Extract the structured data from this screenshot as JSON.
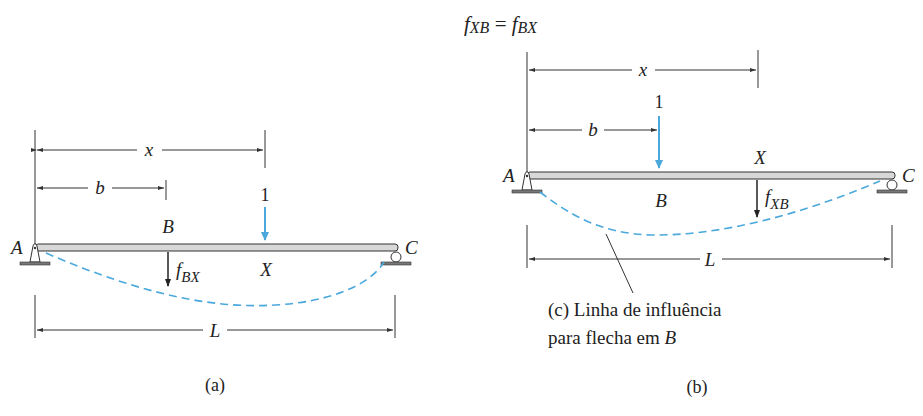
{
  "figure_a": {
    "caption": "(a)",
    "support_left": "A",
    "support_right": "C",
    "point_b": "B",
    "point_x": "X",
    "load_value": "1",
    "dim_x": "x",
    "dim_b": "b",
    "dim_L": "L",
    "deflection_label_main": "f",
    "deflection_label_sub": "BX"
  },
  "figure_b": {
    "caption": "(b)",
    "reciprocity_lhs_main": "f",
    "reciprocity_lhs_sub": "XB",
    "reciprocity_eq": " = ",
    "reciprocity_rhs_main": "f",
    "reciprocity_rhs_sub": "BX",
    "support_left": "A",
    "support_right": "C",
    "point_b": "B",
    "point_x": "X",
    "load_value": "1",
    "dim_x": "x",
    "dim_b": "b",
    "dim_L": "L",
    "deflection_label_main": "f",
    "deflection_label_sub": "XB",
    "influence_caption_line1": "(c) Linha de influência",
    "influence_caption_line2_prefix": "para flecha em ",
    "influence_caption_line2_var": "B"
  },
  "colors": {
    "load_arrow": "#4aa8dc",
    "deflected_shape": "#4aa8dc",
    "ink": "#222222",
    "beam_fill": "#d8d8d8"
  }
}
